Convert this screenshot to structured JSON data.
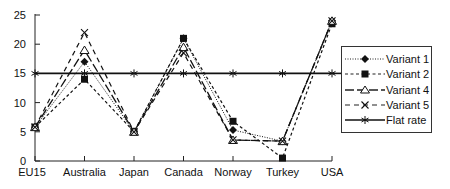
{
  "chart_data": {
    "type": "line",
    "title": "",
    "xlabel": "",
    "ylabel": "",
    "categories": [
      "EU15",
      "Australia",
      "Japan",
      "Canada",
      "Norway",
      "Turkey",
      "USA"
    ],
    "ylim": [
      0,
      25
    ],
    "yticks": [
      0,
      5,
      10,
      15,
      20,
      25
    ],
    "grid": false,
    "legend_position": "right",
    "series": [
      {
        "name": "Variant 1",
        "marker": "diamond",
        "line": "dotted",
        "values": [
          5.8,
          17,
          5,
          21,
          5.3,
          3.4,
          24
        ]
      },
      {
        "name": "Variant 2",
        "marker": "square",
        "line": "dashed-short",
        "values": [
          5.8,
          14,
          5,
          21,
          6.8,
          0.5,
          23.5
        ]
      },
      {
        "name": "Variant 4",
        "marker": "triangle",
        "line": "long-dash",
        "values": [
          5.8,
          19,
          5,
          19.5,
          3.6,
          3.4,
          24
        ]
      },
      {
        "name": "Variant 5",
        "marker": "x",
        "line": "dashed",
        "values": [
          5.8,
          22,
          5,
          18.5,
          3.6,
          3.4,
          24
        ]
      },
      {
        "name": "Flat rate",
        "marker": "asterisk",
        "line": "solid",
        "values": [
          15,
          15,
          15,
          15,
          15,
          15,
          15
        ]
      }
    ]
  }
}
